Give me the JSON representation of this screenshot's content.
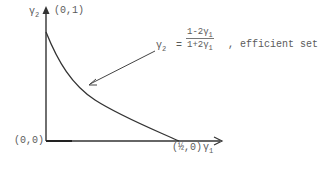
{
  "diagram": {
    "y_axis_label": "γ",
    "y_axis_sub": "2",
    "x_axis_label": "γ",
    "x_axis_sub": "1",
    "point_top": "(0,1)",
    "point_origin": "(0,0)",
    "point_right": "(½,0)",
    "equation": {
      "lhs": "γ",
      "lhs_sub": "2",
      "equals": "=",
      "numerator": "1-2γ",
      "numerator_sub": "1",
      "denominator": "1+2γ",
      "denominator_sub": "1",
      "suffix": ", efficient set"
    },
    "colors": {
      "line": "#333333",
      "text": "#5a5a5a"
    }
  }
}
